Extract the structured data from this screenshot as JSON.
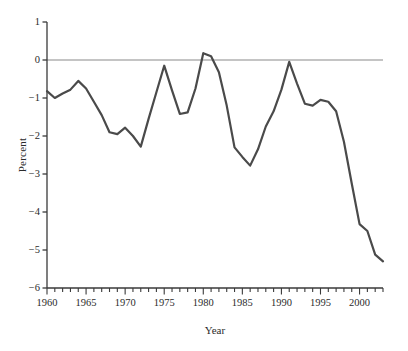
{
  "chart_data": {
    "type": "line",
    "title": "",
    "xlabel": "Year",
    "ylabel": "Percent",
    "xlim": [
      1960,
      2003
    ],
    "ylim": [
      -6,
      1
    ],
    "grid": false,
    "legend": null,
    "zero_reference_line": 0,
    "series_color": "#4a4a4a",
    "axis_color": "#3a3a3a",
    "zero_line_color": "#8a8a8a",
    "x_tick_labels": [
      "1960",
      "1965",
      "1970",
      "1975",
      "1980",
      "1985",
      "1990",
      "1995",
      "2000"
    ],
    "x_major_ticks": [
      1960,
      1965,
      1970,
      1975,
      1980,
      1985,
      1990,
      1995,
      2000
    ],
    "x_minor_tick_interval": 1,
    "y_tick_labels": [
      "1",
      "0",
      "−1",
      "−2",
      "−3",
      "−4",
      "−5",
      "−6"
    ],
    "y_major_ticks": [
      1,
      0,
      -1,
      -2,
      -3,
      -4,
      -5,
      -6
    ],
    "series": [
      {
        "name": "Percent",
        "x": [
          1960,
          1961,
          1962,
          1963,
          1964,
          1965,
          1966,
          1967,
          1968,
          1969,
          1970,
          1971,
          1972,
          1973,
          1974,
          1975,
          1976,
          1977,
          1978,
          1979,
          1980,
          1981,
          1982,
          1983,
          1984,
          1985,
          1986,
          1987,
          1988,
          1989,
          1990,
          1991,
          1992,
          1993,
          1994,
          1995,
          1996,
          1997,
          1998,
          1999,
          2000,
          2001,
          2002,
          2003
        ],
        "values": [
          -0.82,
          -1.0,
          -0.88,
          -0.78,
          -0.55,
          -0.75,
          -1.1,
          -1.45,
          -1.9,
          -1.95,
          -1.78,
          -2.0,
          -2.28,
          -1.55,
          -0.85,
          -0.15,
          -0.8,
          -1.42,
          -1.38,
          -0.75,
          0.18,
          0.1,
          -0.32,
          -1.2,
          -2.3,
          -2.55,
          -2.78,
          -2.35,
          -1.75,
          -1.35,
          -0.78,
          -0.05,
          -0.62,
          -1.15,
          -1.2,
          -1.05,
          -1.1,
          -1.35,
          -2.15,
          -3.25,
          -4.32,
          -4.5,
          -5.12,
          -5.3
        ]
      }
    ]
  },
  "axes": {
    "y_title": "Percent",
    "x_title": "Year"
  }
}
